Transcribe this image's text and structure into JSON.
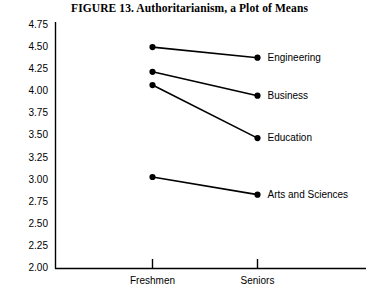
{
  "chart_data": {
    "type": "line",
    "title": "FIGURE 13.  Authoritarianism, a Plot of Means",
    "xlabel": "",
    "ylabel": "",
    "categories": [
      "Freshmen",
      "Seniors"
    ],
    "x_tick_labels": [
      "Freshmen",
      "Seniors"
    ],
    "y_tick_labels": [
      "4.75",
      "4.50",
      "4.25",
      "4.00",
      "3.75",
      "3.50",
      "3.25",
      "3.00",
      "2.75",
      "2.50",
      "2.25",
      "2.00"
    ],
    "y_tick_values": [
      4.75,
      4.5,
      4.25,
      4.0,
      3.75,
      3.5,
      3.25,
      3.0,
      2.75,
      2.5,
      2.25,
      2.0
    ],
    "ylim": [
      2.0,
      4.75
    ],
    "grid": false,
    "legend_position": "right-inline-labels",
    "marker": "filled-circle",
    "line_color": "#000000",
    "series": [
      {
        "name": "Engineering",
        "values": [
          4.5,
          4.38
        ]
      },
      {
        "name": "Business",
        "values": [
          4.22,
          3.95
        ]
      },
      {
        "name": "Education",
        "values": [
          4.07,
          3.47
        ]
      },
      {
        "name": "Arts and Sciences",
        "values": [
          3.03,
          2.83
        ]
      }
    ]
  }
}
